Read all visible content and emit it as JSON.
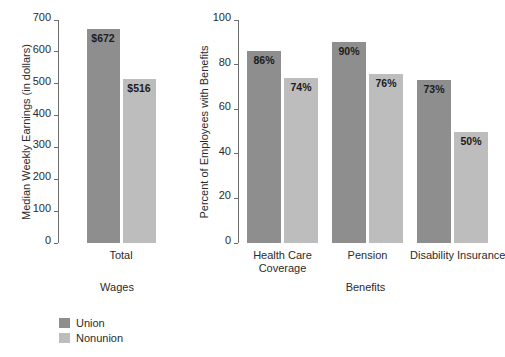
{
  "legend": {
    "entries": [
      {
        "label": "Union",
        "color": "#8e8e8e"
      },
      {
        "label": "Nonunion",
        "color": "#bdbdbd"
      }
    ]
  },
  "chart_data": [
    {
      "type": "bar",
      "title": "",
      "xlabel": "Wages",
      "ylabel": "Median Weekly Earnings (in dollars)",
      "categories": [
        "Total"
      ],
      "ylim": [
        0,
        700
      ],
      "yticks": [
        0,
        100,
        200,
        300,
        400,
        500,
        600,
        700
      ],
      "grid": false,
      "legend_position": "below-left",
      "series": [
        {
          "name": "Union",
          "color": "#8e8e8e",
          "values": [
            672
          ],
          "labels": [
            "$672"
          ]
        },
        {
          "name": "Nonunion",
          "color": "#bdbdbd",
          "values": [
            516
          ],
          "labels": [
            "$516"
          ]
        }
      ]
    },
    {
      "type": "bar",
      "title": "",
      "xlabel": "Benefits",
      "ylabel": "Percent of Employees with Benefits",
      "categories": [
        "Health Care Coverage",
        "Pension",
        "Disability Insurance"
      ],
      "ylim": [
        0,
        100
      ],
      "yticks": [
        0,
        20,
        40,
        60,
        80,
        100
      ],
      "grid": false,
      "legend_position": "below-left",
      "series": [
        {
          "name": "Union",
          "color": "#8e8e8e",
          "values": [
            86,
            90,
            73
          ],
          "labels": [
            "86%",
            "90%",
            "73%"
          ]
        },
        {
          "name": "Nonunion",
          "color": "#bdbdbd",
          "values": [
            74,
            76,
            50
          ],
          "labels": [
            "74%",
            "76%",
            "50%"
          ]
        }
      ]
    }
  ]
}
